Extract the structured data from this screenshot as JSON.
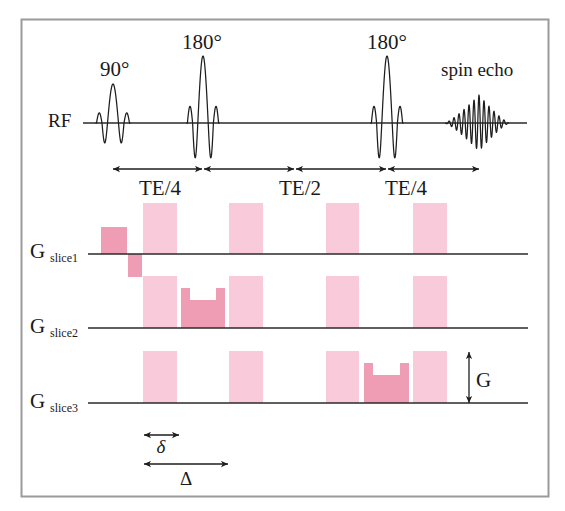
{
  "figure": {
    "rf": {
      "label": "RF",
      "pulses": [
        {
          "label": "90°"
        },
        {
          "label": "180°"
        },
        {
          "label": "180°"
        }
      ],
      "echo_label": "spin echo"
    },
    "timing": [
      {
        "label": "TE/4"
      },
      {
        "label": "TE/2"
      },
      {
        "label": "TE/4"
      }
    ],
    "gradients": [
      {
        "label": "G",
        "subscript": "slice1"
      },
      {
        "label": "G",
        "subscript": "slice2"
      },
      {
        "label": "G",
        "subscript": "slice3"
      }
    ],
    "amplitude_label": "G",
    "small_delta": "δ",
    "large_delta": "Δ"
  },
  "colors": {
    "diffusion_gradient": "#F8CADA",
    "slice_gradient": "#EE9DB4",
    "line": "#1E1E1E",
    "frame": "#9A9A9A"
  }
}
